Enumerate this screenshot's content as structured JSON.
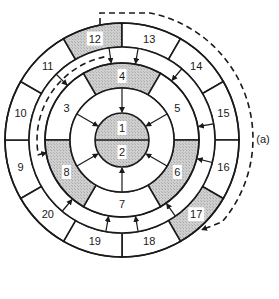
{
  "figure_label": "(a)",
  "colors": {
    "shade": "#c9c9c9",
    "line": "#1a1a1a",
    "background": "#ffffff"
  },
  "center": {
    "top_label": "1",
    "bottom_label": "2",
    "shaded": true
  },
  "middle_ring": {
    "segments": [
      {
        "label": "3",
        "start_deg": 180,
        "end_deg": 240,
        "shaded": false
      },
      {
        "label": "4",
        "start_deg": 240,
        "end_deg": 300,
        "shaded": true
      },
      {
        "label": "5",
        "start_deg": 300,
        "end_deg": 360,
        "shaded": false
      },
      {
        "label": "6",
        "start_deg": 0,
        "end_deg": 60,
        "shaded": true
      },
      {
        "label": "7",
        "start_deg": 60,
        "end_deg": 120,
        "shaded": false
      },
      {
        "label": "8",
        "start_deg": 120,
        "end_deg": 180,
        "shaded": true
      }
    ]
  },
  "outer_ring": {
    "segments": [
      {
        "label": "9",
        "start_deg": 150,
        "end_deg": 180,
        "shaded": false
      },
      {
        "label": "10",
        "start_deg": 180,
        "end_deg": 210,
        "shaded": false
      },
      {
        "label": "11",
        "start_deg": 210,
        "end_deg": 240,
        "shaded": false
      },
      {
        "label": "12",
        "start_deg": 240,
        "end_deg": 270,
        "shaded": true
      },
      {
        "label": "13",
        "start_deg": 270,
        "end_deg": 300,
        "shaded": false
      },
      {
        "label": "14",
        "start_deg": 300,
        "end_deg": 330,
        "shaded": false
      },
      {
        "label": "15",
        "start_deg": 330,
        "end_deg": 360,
        "shaded": false
      },
      {
        "label": "16",
        "start_deg": 0,
        "end_deg": 30,
        "shaded": false
      },
      {
        "label": "17",
        "start_deg": 30,
        "end_deg": 60,
        "shaded": true
      },
      {
        "label": "18",
        "start_deg": 60,
        "end_deg": 90,
        "shaded": false
      },
      {
        "label": "19",
        "start_deg": 90,
        "end_deg": 120,
        "shaded": false
      },
      {
        "label": "20",
        "start_deg": 120,
        "end_deg": 150,
        "shaded": false
      }
    ]
  },
  "arrows": {
    "inner_to_center_deg": [
      270,
      330,
      30,
      90,
      150,
      210
    ],
    "outer_to_middle_deg": [
      262,
      225,
      130,
      100,
      80,
      55,
      14,
      350,
      310,
      280
    ]
  },
  "dashed_path": {
    "description": "from 17 up around right side over top to 12, then through corridor ring counter-clockwise down to near 9/8"
  }
}
